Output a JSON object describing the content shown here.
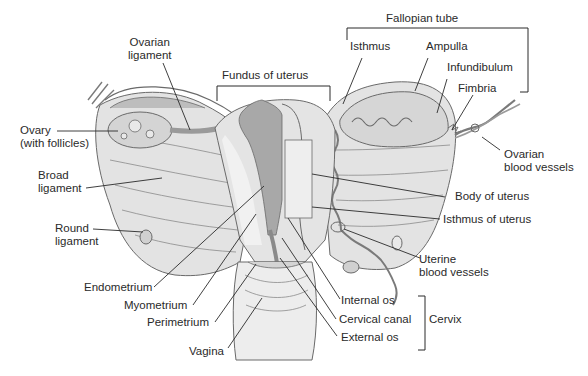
{
  "diagram": {
    "colors": {
      "tissue_light": "#e6e6e6",
      "tissue_mid": "#cfcfcf",
      "tissue_dark": "#a8a8a8",
      "outline": "#6a6a6a",
      "leader": "#2a2a2a",
      "text": "#2a2a2a"
    },
    "labels": {
      "fallopian_tube": "Fallopian tube",
      "isthmus": "Isthmus",
      "ampulla": "Ampulla",
      "infundibulum": "Infundibulum",
      "fimbria": "Fimbria",
      "ovarian_vessels_1": "Ovarian",
      "ovarian_vessels_2": "blood vessels",
      "fundus": "Fundus of uterus",
      "ovarian_ligament_1": "Ovarian",
      "ovarian_ligament_2": "ligament",
      "ovary_1": "Ovary",
      "ovary_2": "(with follicles)",
      "broad_ligament_1": "Broad",
      "broad_ligament_2": "ligament",
      "round_ligament_1": "Round",
      "round_ligament_2": "ligament",
      "body_of_uterus": "Body of uterus",
      "isthmus_of_uterus": "Isthmus of uterus",
      "uterine_vessels_1": "Uterine",
      "uterine_vessels_2": "blood vessels",
      "endometrium": "Endometrium",
      "myometrium": "Myometrium",
      "perimetrium": "Perimetrium",
      "vagina": "Vagina",
      "internal_os": "Internal os",
      "cervical_canal": "Cervical canal",
      "external_os": "External os",
      "cervix": "Cervix"
    }
  }
}
